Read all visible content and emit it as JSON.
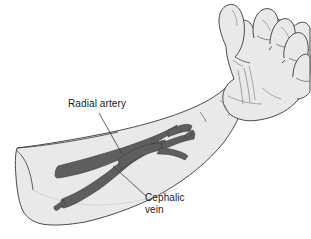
{
  "figure": {
    "name": "forearm-vasculature-illustration",
    "background_color": "#ffffff",
    "skin_fill_color": "#e9e9e9",
    "outline_color": "#4a4a4a",
    "vessel_color": "#5e5e5e",
    "vessel_outline_color": "#3a3a3a",
    "leader_line_color": "#3a3a3a",
    "text_color": "#1a1a1a"
  },
  "labels": {
    "radial_artery": {
      "text": "Radial artery",
      "icon": "callout-label"
    },
    "cephalic_vein": {
      "line1": "Cephalic",
      "line2": "vein",
      "icon": "callout-label"
    }
  },
  "structures": [
    {
      "name": "radial-artery",
      "label": "Radial artery",
      "type": "artery",
      "color": "#5e5e5e"
    },
    {
      "name": "cephalic-vein",
      "label": "Cephalic vein",
      "type": "vein",
      "color": "#5e5e5e"
    },
    {
      "name": "forearm",
      "label": "Forearm",
      "type": "limb-segment"
    },
    {
      "name": "hand",
      "label": "Hand",
      "type": "limb-segment"
    }
  ]
}
